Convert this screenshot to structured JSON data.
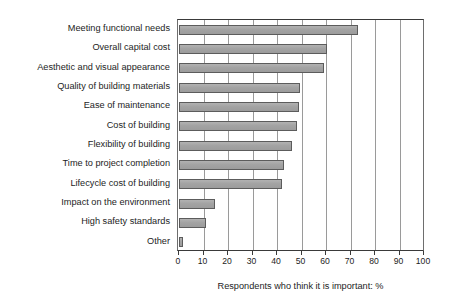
{
  "chart_data": {
    "type": "bar",
    "orientation": "horizontal",
    "title": "",
    "xlabel": "Respondents who think it is important: %",
    "ylabel": "",
    "xlim": [
      0,
      100
    ],
    "xticks": [
      0,
      10,
      20,
      30,
      40,
      50,
      60,
      70,
      80,
      90,
      100
    ],
    "grid": "vertical",
    "legend": null,
    "bar_color": "#a6a6a6",
    "bar_edge_color": "#5c5c5c",
    "categories": [
      "Meeting functional needs",
      "Overall capital cost",
      "Aesthetic and visual appearance",
      "Quality of building materials",
      "Ease of maintenance",
      "Cost of building",
      "Flexibility of building",
      "Time to project completion",
      "Lifecycle cost of building",
      "Impact on the environment",
      "High safety standards",
      "Other"
    ],
    "values": [
      73,
      60.5,
      59,
      49.5,
      49,
      48,
      46,
      43,
      42,
      14.5,
      11,
      1.5
    ]
  }
}
